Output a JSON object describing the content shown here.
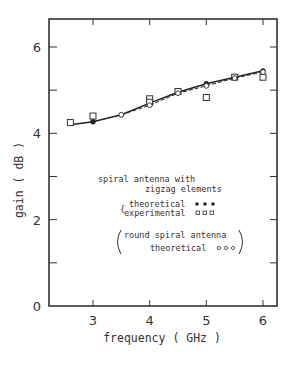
{
  "chart_data": {
    "type": "line",
    "title": "",
    "xlabel": "frequency ( GHz )",
    "ylabel": "gain ( dB )",
    "xlim": [
      2.3,
      6.25
    ],
    "ylim": [
      0,
      6.6
    ],
    "x_ticks": [
      3,
      4,
      5,
      6
    ],
    "x_tick_labels": [
      "3",
      "4",
      "5",
      "6"
    ],
    "y_ticks": [
      0,
      1,
      2,
      3,
      4,
      5,
      6
    ],
    "y_tick_labels": [
      "0",
      "",
      "2",
      "",
      "4",
      "",
      "6"
    ],
    "grid": false,
    "series": [
      {
        "name": "spiral antenna with zigzag elements — theoretical",
        "marker": "filled-circle",
        "line": "solid",
        "x": [
          2.6,
          3.0,
          3.5,
          4.0,
          4.5,
          5.0,
          5.5,
          6.0
        ],
        "y": [
          4.2,
          4.27,
          4.43,
          4.7,
          4.95,
          5.15,
          5.3,
          5.45
        ]
      },
      {
        "name": "spiral antenna with zigzag elements — experimental",
        "marker": "open-square",
        "line": "none",
        "x": [
          2.6,
          3.0,
          4.0,
          4.0,
          4.5,
          5.0,
          5.5,
          6.0
        ],
        "y": [
          4.25,
          4.4,
          4.8,
          4.72,
          4.97,
          4.83,
          5.3,
          5.3
        ]
      },
      {
        "name": "round spiral antenna — theoretical",
        "marker": "open-circle",
        "line": "dashed",
        "x": [
          3.5,
          4.0,
          4.5,
          5.0,
          5.5,
          6.0
        ],
        "y": [
          4.43,
          4.65,
          4.93,
          5.1,
          5.28,
          5.42
        ]
      }
    ],
    "legend": {
      "position": "inside-lower-center",
      "heading_line1": "spiral antenna with",
      "heading_line2": "zigzag elements",
      "entries": [
        {
          "label": "theoretical",
          "symbol": "● ● ●"
        },
        {
          "label": "experimental",
          "symbol": "□ □ □"
        },
        {
          "label": "round spiral antenna",
          "symbol": ""
        },
        {
          "label": "theoretical",
          "symbol": "○ ○ ○"
        }
      ]
    }
  }
}
